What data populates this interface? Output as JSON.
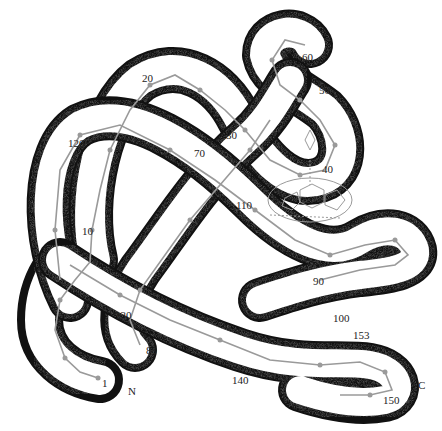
{
  "diagram": {
    "type": "protein-backbone-tube",
    "tube_color": "#ffffff",
    "outline_color": "#111111",
    "stipple_color": "#333333",
    "backbone_color": "#9a9a9a",
    "labels": [
      {
        "id": "n1",
        "text": "1",
        "x": 102,
        "y": 378
      },
      {
        "id": "nN",
        "text": "N",
        "x": 128,
        "y": 386
      },
      {
        "id": "n10",
        "text": "10",
        "x": 82,
        "y": 226
      },
      {
        "id": "n20",
        "text": "20",
        "x": 142,
        "y": 73
      },
      {
        "id": "n30",
        "text": "30",
        "x": 226,
        "y": 130
      },
      {
        "id": "n40",
        "text": "40",
        "x": 322,
        "y": 164
      },
      {
        "id": "n50",
        "text": "50",
        "x": 319,
        "y": 85
      },
      {
        "id": "n60",
        "text": "60",
        "x": 302,
        "y": 52
      },
      {
        "id": "n70",
        "text": "70",
        "x": 194,
        "y": 148
      },
      {
        "id": "n80",
        "text": "80",
        "x": 146,
        "y": 345
      },
      {
        "id": "n90",
        "text": "90",
        "x": 313,
        "y": 276
      },
      {
        "id": "n100",
        "text": "100",
        "x": 333,
        "y": 313
      },
      {
        "id": "n110",
        "text": "110",
        "x": 236,
        "y": 200
      },
      {
        "id": "n120",
        "text": "120",
        "x": 68,
        "y": 138
      },
      {
        "id": "n130",
        "text": "130",
        "x": 115,
        "y": 310
      },
      {
        "id": "n140",
        "text": "140",
        "x": 232,
        "y": 375
      },
      {
        "id": "n150",
        "text": "150",
        "x": 383,
        "y": 395
      },
      {
        "id": "n153",
        "text": "153",
        "x": 353,
        "y": 330
      },
      {
        "id": "nC",
        "text": "C",
        "x": 418,
        "y": 380
      }
    ]
  }
}
